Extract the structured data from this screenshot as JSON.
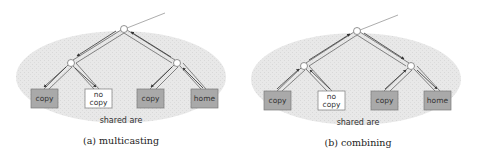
{
  "colors": {
    "ellipse_fill": "#e6e6e6",
    "copy_box_fill": "#a9a9a9",
    "nocopy_box_fill": "#ffffff",
    "box_stroke": "#7a7a7a",
    "arrow": "#333333",
    "node_fill": "#ffffff"
  },
  "panels": [
    {
      "id": "a",
      "caption": "(a) multicasting",
      "area_label": "shared are",
      "direction": "down",
      "boxes": [
        {
          "label": "copy",
          "lines": [
            "copy"
          ],
          "type": "copy"
        },
        {
          "label": "no copy",
          "lines": [
            "no",
            "copy"
          ],
          "type": "nocopy"
        },
        {
          "label": "copy",
          "lines": [
            "copy"
          ],
          "type": "copy"
        },
        {
          "label": "home",
          "lines": [
            "home"
          ],
          "type": "copy"
        }
      ]
    },
    {
      "id": "b",
      "caption": "(b) combining",
      "area_label": "shared are",
      "direction": "up",
      "boxes": [
        {
          "label": "copy",
          "lines": [
            "copy"
          ],
          "type": "copy"
        },
        {
          "label": "no copy",
          "lines": [
            "no",
            "copy"
          ],
          "type": "nocopy"
        },
        {
          "label": "copy",
          "lines": [
            "copy"
          ],
          "type": "copy"
        },
        {
          "label": "home",
          "lines": [
            "home"
          ],
          "type": "copy"
        }
      ]
    }
  ]
}
